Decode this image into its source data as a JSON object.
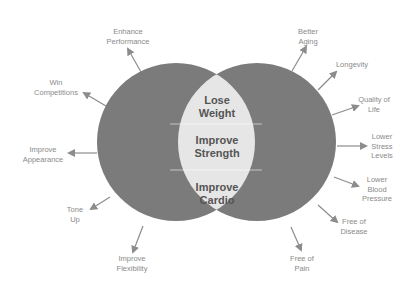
{
  "diagram": {
    "type": "venn",
    "colors": {
      "circle_fill": "#7b7b7b",
      "overlap_fill": "#e6e6e6",
      "arrow": "#8c8c8c",
      "label_text": "#8a8a8a",
      "center_text": "#555555",
      "background": "#ffffff"
    },
    "overlap": {
      "items": [
        "Lose Weight",
        "Improve Strength",
        "Improve Cardio"
      ],
      "lines": [
        [
          "Lose",
          "Weight"
        ],
        [
          "Improve",
          "Strength"
        ],
        [
          "Improve",
          "Cardio"
        ]
      ]
    },
    "left_circle": {
      "labels": [
        {
          "lines": [
            "Enhance",
            "Performance"
          ]
        },
        {
          "lines": [
            "Win",
            "Competitions"
          ]
        },
        {
          "lines": [
            "Improve",
            "Appearance"
          ]
        },
        {
          "lines": [
            "Tone",
            "Up"
          ]
        },
        {
          "lines": [
            "Improve",
            "Flexibility"
          ]
        }
      ]
    },
    "right_circle": {
      "labels": [
        {
          "lines": [
            "Better",
            "Aging"
          ]
        },
        {
          "lines": [
            "Longevity"
          ]
        },
        {
          "lines": [
            "Quality of",
            "Life"
          ]
        },
        {
          "lines": [
            "Lower",
            "Stress",
            "Levels"
          ]
        },
        {
          "lines": [
            "Lower",
            "Blood",
            "Pressure"
          ]
        },
        {
          "lines": [
            "Free of",
            "Disease"
          ]
        },
        {
          "lines": [
            "Free of",
            "Pain"
          ]
        }
      ]
    }
  }
}
